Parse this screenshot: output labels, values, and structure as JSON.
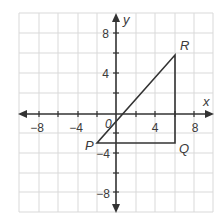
{
  "figure": {
    "type": "coordinate-plane",
    "axes": {
      "x_label": "x",
      "y_label": "y",
      "origin_label": "0",
      "range": [
        -10,
        10
      ],
      "grid_step": 2,
      "x_tick_labels": [
        "−8",
        "−4",
        "4",
        "8"
      ],
      "y_tick_labels": [
        "8",
        "4",
        "−4",
        "−8"
      ]
    },
    "points": [
      {
        "label": "P",
        "x": -2,
        "y": -3
      },
      {
        "label": "Q",
        "x": 6,
        "y": -3
      },
      {
        "label": "R",
        "x": 6,
        "y": 6
      }
    ],
    "shape": "triangle PQR",
    "colors": {
      "grid": "#d6d6d6",
      "axis": "#333333",
      "shape": "#333333"
    }
  }
}
